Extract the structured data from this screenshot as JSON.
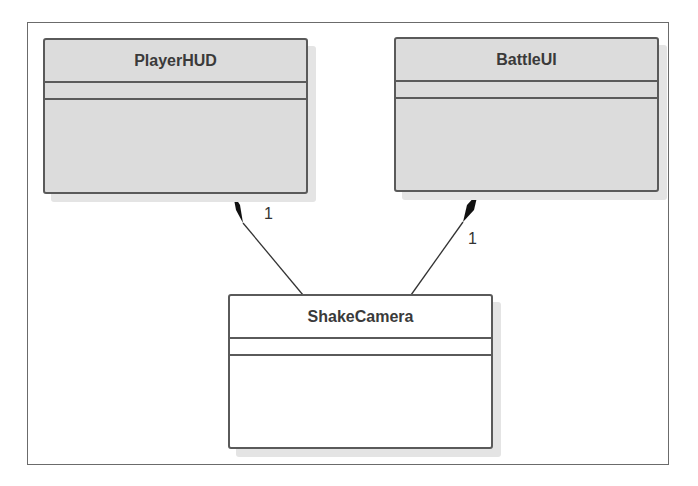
{
  "diagram": {
    "type": "UML class diagram",
    "classes": [
      {
        "id": "playerhud",
        "name": "PlayerHUD",
        "attributes": [],
        "operations": []
      },
      {
        "id": "battleui",
        "name": "BattleUI",
        "attributes": [],
        "operations": []
      },
      {
        "id": "shakecamera",
        "name": "ShakeCamera",
        "attributes": [],
        "operations": []
      }
    ],
    "relationships": [
      {
        "type": "composition",
        "whole": "PlayerHUD",
        "part": "ShakeCamera",
        "multiplicity": "1"
      },
      {
        "type": "composition",
        "whole": "BattleUI",
        "part": "ShakeCamera",
        "multiplicity": "1"
      }
    ]
  },
  "colors": {
    "border": "#5a5a5a",
    "gray_fill": "#dcdcdc",
    "white_fill": "#ffffff",
    "shadow": "#e4e4e4"
  }
}
